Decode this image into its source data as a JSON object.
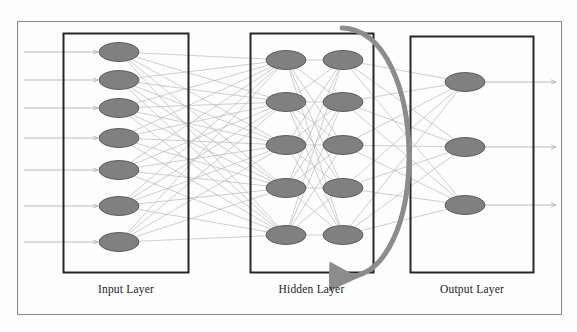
{
  "figure": {
    "type": "neural-network-diagram",
    "title": "",
    "background_color": "#fefefe",
    "outer_frame": {
      "x": 17,
      "y": 21,
      "width": 545,
      "height": 294,
      "stroke": "#8a8a8a",
      "stroke_width": 1
    }
  },
  "palette": {
    "node_fill": "#808080",
    "node_stroke": "#5d5d5d",
    "box_stroke": "#262626",
    "connection_stroke": "#b9b9b9",
    "io_arrow_stroke": "#b0b0b0",
    "recurrent_arrow": "#8c8c8c",
    "label_color": "#1b1b1b"
  },
  "layers": [
    {
      "id": "input",
      "label": "Input Layer",
      "box": {
        "x": 63,
        "y": 33,
        "width": 125,
        "height": 239
      },
      "label_pos": {
        "x": 63,
        "y": 283,
        "width": 126
      },
      "node_count": 7,
      "columns": 1,
      "nodes": [
        {
          "cx": 119,
          "cy": 52
        },
        {
          "cx": 119,
          "cy": 80
        },
        {
          "cx": 119,
          "cy": 108
        },
        {
          "cx": 119,
          "cy": 138
        },
        {
          "cx": 119,
          "cy": 170
        },
        {
          "cx": 119,
          "cy": 206
        },
        {
          "cx": 119,
          "cy": 242
        }
      ],
      "node_rx": 20,
      "node_ry": 9.5,
      "has_incoming_arrows": true,
      "incoming_arrow_x_start": 24
    },
    {
      "id": "hidden",
      "label": "Hidden Layer",
      "box": {
        "x": 250,
        "y": 33,
        "width": 123,
        "height": 239
      },
      "label_pos": {
        "x": 250,
        "y": 283,
        "width": 123
      },
      "node_count": 10,
      "columns": 2,
      "nodes": [
        {
          "cx": 286,
          "cy": 60
        },
        {
          "cx": 286,
          "cy": 102
        },
        {
          "cx": 286,
          "cy": 145
        },
        {
          "cx": 286,
          "cy": 188
        },
        {
          "cx": 286,
          "cy": 235
        },
        {
          "cx": 343,
          "cy": 60
        },
        {
          "cx": 343,
          "cy": 102
        },
        {
          "cx": 343,
          "cy": 145
        },
        {
          "cx": 343,
          "cy": 188
        },
        {
          "cx": 343,
          "cy": 235
        }
      ],
      "node_rx": 20,
      "node_ry": 9.5,
      "has_incoming_arrows": false
    },
    {
      "id": "output",
      "label": "Output Layer",
      "box": {
        "x": 410,
        "y": 36,
        "width": 123,
        "height": 236
      },
      "label_pos": {
        "x": 410,
        "y": 283,
        "width": 124
      },
      "node_count": 3,
      "columns": 1,
      "nodes": [
        {
          "cx": 465,
          "cy": 82
        },
        {
          "cx": 465,
          "cy": 147
        },
        {
          "cx": 465,
          "cy": 205
        }
      ],
      "node_rx": 20,
      "node_ry": 9.5,
      "has_outgoing_arrows": true,
      "outgoing_arrow_x_end": 556
    }
  ],
  "recurrent_connection": {
    "description": "feedback arrow from hidden layer top right curving around output layer back to hidden layer bottom",
    "start": {
      "x": 342,
      "y": 28
    },
    "end": {
      "x": 344,
      "y": 277
    },
    "control_1": {
      "x": 430,
      "y": 30
    },
    "control_2": {
      "x": 432,
      "y": 280
    },
    "stroke": "#8c8c8c",
    "stroke_width": 5,
    "arrowhead": "left"
  },
  "connections": {
    "input_to_hidden": "fully-connected 7 x 5",
    "hidden_intra": "column1 to column2 fully-connected 5 x 5",
    "hidden_to_output": "fully-connected 5 x 3",
    "stroke": "#b9b9b9",
    "stroke_width": 0.7
  }
}
